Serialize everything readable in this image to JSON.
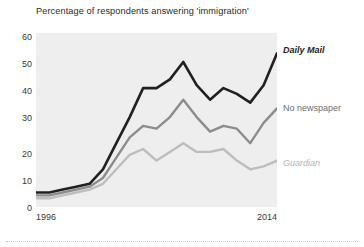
{
  "chart_data": {
    "type": "line",
    "title": "Percentage of respondents answering 'immigration'",
    "subtitle": "",
    "xlabel": "",
    "ylabel": "",
    "xlim": [
      1996,
      2014
    ],
    "ylim": [
      0,
      60
    ],
    "yticks": [
      0,
      10,
      20,
      30,
      40,
      50,
      60
    ],
    "ytick_labels": [
      "0",
      "10",
      "20",
      "30",
      "40",
      "50",
      "60"
    ],
    "xticks": [
      1996,
      2014
    ],
    "xtick_labels": [
      "1996",
      "2014"
    ],
    "grid": false,
    "legend_position": "right-inline",
    "plot_background": "#eeeeee",
    "x": [
      1996,
      1997,
      1998,
      1999,
      2000,
      2001,
      2002,
      2003,
      2004,
      2005,
      2006,
      2007,
      2008,
      2009,
      2010,
      2011,
      2012,
      2013,
      2014
    ],
    "series": [
      {
        "name": "Daily Mail",
        "color": "#231f20",
        "label_style": "italic",
        "values": [
          5,
          5,
          6,
          7,
          8,
          13,
          22,
          31,
          41,
          41,
          44,
          50,
          42,
          37,
          41,
          39,
          36,
          42,
          53
        ]
      },
      {
        "name": "No newspaper",
        "color": "#8c8c8c",
        "label_style": "normal",
        "values": [
          4,
          4,
          5,
          6,
          7,
          10,
          17,
          24,
          28,
          27,
          31,
          37,
          31,
          26,
          28,
          27,
          22,
          29,
          34
        ]
      },
      {
        "name": "Guardian",
        "color": "#bdbdbd",
        "label_style": "italic",
        "values": [
          3,
          3,
          4,
          5,
          6,
          8,
          13,
          18,
          20,
          16,
          19,
          22,
          19,
          19,
          20,
          16,
          13,
          14,
          16
        ]
      }
    ]
  },
  "chart": {
    "title": "Percentage of respondents answering 'immigration'",
    "x_start_label": "1996",
    "x_end_label": "2014",
    "y_labels": [
      "60",
      "50",
      "40",
      "30",
      "20",
      "10",
      "0"
    ],
    "series_labels": {
      "daily_mail": "Daily Mail",
      "no_newspaper": "No newspaper",
      "guardian": "Guardian"
    }
  }
}
